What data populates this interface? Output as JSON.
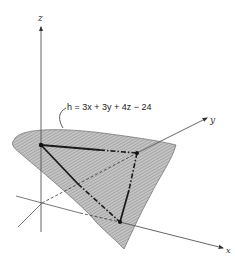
{
  "diagram": {
    "type": "3d-plane-intersection",
    "equation": {
      "lhs": "h",
      "text": "h = 3x + 3y + 4z − 24"
    },
    "axes": {
      "x": "x",
      "y": "y",
      "z": "z"
    },
    "plane": {
      "description": "hatched plane h = 0 intersecting the coordinate axes",
      "fill_color": "#b8b8b8",
      "hatch_color": "#8a8a8a"
    },
    "triangle": {
      "vertices": [
        "z-intercept",
        "y-intercept",
        "x-intercept"
      ],
      "edge_color": "#1a1a1a"
    },
    "colors": {
      "axis": "#555555",
      "ink": "#1a1a1a"
    }
  }
}
